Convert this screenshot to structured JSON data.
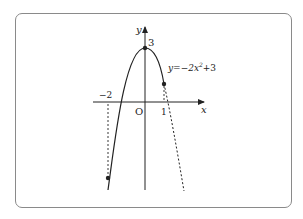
{
  "diagram": {
    "type": "function-graph",
    "equation_label": "y=−2x²+3",
    "equation_parts": {
      "prefix": "y=−2x",
      "exp": "2",
      "suffix": "+3"
    },
    "axis_labels": {
      "x": "x",
      "y": "y",
      "origin": "O"
    },
    "tick_labels": {
      "vertex_y": "3",
      "x_neg2": "−2",
      "x_1": "1"
    },
    "points": [
      {
        "name": "vertex",
        "x": 0,
        "y": 3
      },
      {
        "name": "right-endpoint",
        "x": 1,
        "y": 1
      },
      {
        "name": "left-endpoint",
        "x": -2,
        "y": -5
      }
    ],
    "solid_domain": [
      -2,
      1
    ],
    "colors": {
      "stroke": "#222222",
      "frame": "#8a8a8a"
    }
  }
}
